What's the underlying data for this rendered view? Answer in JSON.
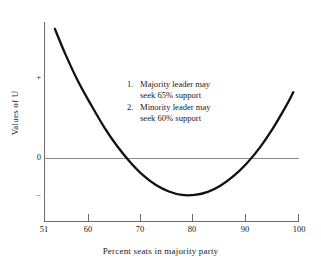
{
  "chart_data": {
    "type": "line",
    "title": "",
    "xlabel": "Percent seats in majority party",
    "ylabel": "Values of U",
    "xlim": [
      51,
      100
    ],
    "ylim": [
      -1.35,
      3.6
    ],
    "grid": false,
    "legend": "none",
    "xticks": [
      {
        "value": 51,
        "label": "51"
      },
      {
        "value": 60,
        "label": "60"
      },
      {
        "value": 70,
        "label": "70"
      },
      {
        "value": 80,
        "label": "80"
      },
      {
        "value": 90,
        "label": "90"
      },
      {
        "value": 100,
        "label": "100"
      }
    ],
    "yticks": [
      {
        "value": 1.7,
        "label": "+"
      },
      {
        "value": 0,
        "label": "0"
      },
      {
        "value": -0.8,
        "label": "−"
      }
    ],
    "zero_line": {
      "y": 0,
      "x_from": 51,
      "x_to": 100
    },
    "series": [
      {
        "name": "U",
        "x": [
          53.0,
          55.0,
          57.5,
          60.0,
          62.5,
          65.0,
          67.5,
          70.0,
          72.5,
          75.0,
          77.5,
          80.0,
          82.5,
          85.0,
          87.5,
          90.0,
          92.5,
          95.0,
          97.5,
          99.0
        ],
        "y": [
          3.42,
          2.76,
          2.03,
          1.41,
          0.83,
          0.33,
          -0.09,
          -0.44,
          -0.7,
          -0.87,
          -0.96,
          -0.96,
          -0.88,
          -0.71,
          -0.46,
          -0.13,
          0.28,
          0.78,
          1.36,
          1.75
        ]
      }
    ],
    "annotations": {
      "items": [
        {
          "number": "1.",
          "line1": "Majority leader may",
          "line2": "seek 65% support"
        },
        {
          "number": "2.",
          "line1": "Minority leader may",
          "line2": "seek 60% support"
        }
      ]
    },
    "colors": {
      "curve": "#111111",
      "axis": "#6b6b6b",
      "zero_line": "#8a8a8a",
      "text": "#1a1a1a",
      "background": "#ffffff"
    }
  }
}
